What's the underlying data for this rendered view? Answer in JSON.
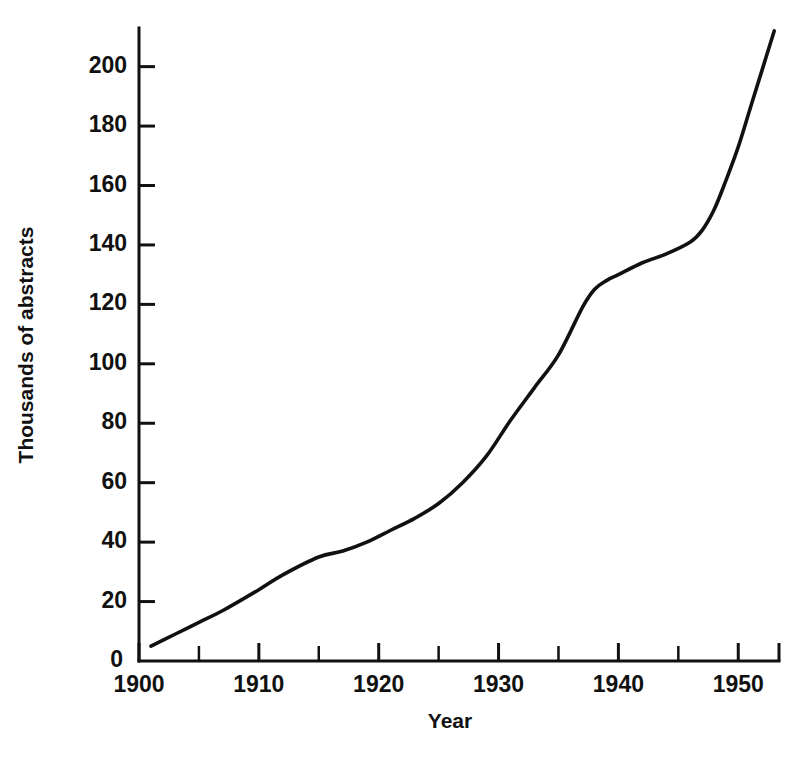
{
  "chart_data": {
    "type": "line",
    "title": "",
    "subtitle": "",
    "xlabel": "Year",
    "ylabel": "Thousands of abstracts",
    "xlim": [
      1900,
      1953.4
    ],
    "ylim": [
      0,
      213
    ],
    "grid": false,
    "legend": null,
    "x_tick_labels": [
      "1900",
      "1910",
      "1920",
      "1930",
      "1940",
      "1950"
    ],
    "x_tick_values": [
      1900,
      1910,
      1920,
      1930,
      1940,
      1950
    ],
    "x_minor_tick_values": [
      1905,
      1915,
      1925,
      1935,
      1945
    ],
    "y_tick_labels": [
      "0",
      "20",
      "40",
      "60",
      "80",
      "100",
      "120",
      "140",
      "160",
      "180",
      "200"
    ],
    "y_tick_values": [
      0,
      20,
      40,
      60,
      80,
      100,
      120,
      140,
      160,
      180,
      200
    ],
    "series": [
      {
        "name": "Chemical Abstracts",
        "x": [
          1901,
          1903,
          1905,
          1907,
          1910,
          1912,
          1915,
          1917,
          1919,
          1921,
          1923,
          1925,
          1927,
          1929,
          1931,
          1933,
          1935,
          1937,
          1938,
          1939,
          1940,
          1942,
          1944,
          1946,
          1947,
          1948,
          1949,
          1950,
          1951,
          1952,
          1953
        ],
        "values": [
          5,
          9,
          13,
          17,
          24,
          29,
          35,
          37,
          40,
          44,
          48,
          53,
          60,
          69,
          81,
          92,
          103,
          119,
          125,
          128,
          130,
          134,
          137,
          141,
          145,
          152,
          162,
          173,
          186,
          199,
          212
        ]
      }
    ],
    "annotations": []
  }
}
